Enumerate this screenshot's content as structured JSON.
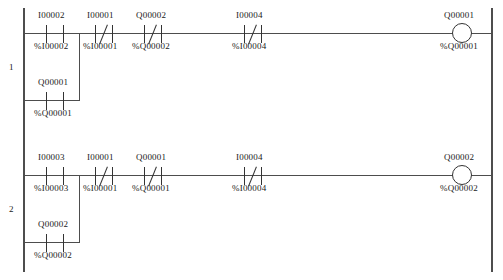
{
  "diagram": {
    "rail_color": "#4d4d4d",
    "line_color": "#333333",
    "text_color": "#1a1a1a"
  },
  "rungs": [
    {
      "number": "1",
      "series": [
        {
          "name": "I00002",
          "address": "%I00002",
          "type": "contact-no"
        },
        {
          "name": "I00001",
          "address": "%I00001",
          "type": "contact-nc"
        },
        {
          "name": "Q00002",
          "address": "%Q00002",
          "type": "contact-nc"
        },
        {
          "name": "I00004",
          "address": "%I00004",
          "type": "contact-nc"
        }
      ],
      "branch": [
        {
          "name": "Q00001",
          "address": "%Q00001",
          "type": "contact-no"
        }
      ],
      "output": {
        "name": "Q00001",
        "address": "%Q00001",
        "type": "coil"
      }
    },
    {
      "number": "2",
      "series": [
        {
          "name": "I00003",
          "address": "%I00003",
          "type": "contact-no"
        },
        {
          "name": "I00001",
          "address": "%I00001",
          "type": "contact-nc"
        },
        {
          "name": "Q00001",
          "address": "%Q00001",
          "type": "contact-nc"
        },
        {
          "name": "I00004",
          "address": "%I00004",
          "type": "contact-nc"
        }
      ],
      "branch": [
        {
          "name": "Q00002",
          "address": "%Q00002",
          "type": "contact-no"
        }
      ],
      "output": {
        "name": "Q00002",
        "address": "%Q00002",
        "type": "coil"
      }
    }
  ]
}
